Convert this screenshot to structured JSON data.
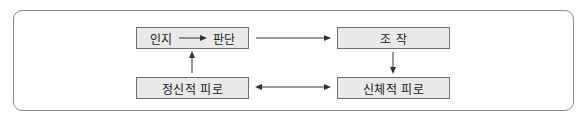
{
  "diagram": {
    "nodes": [
      {
        "id": "perception-judgment",
        "left": "인지",
        "right": "판단"
      },
      {
        "id": "mental-fatigue",
        "label": "정신적 피로"
      },
      {
        "id": "operation",
        "label": "조 작"
      },
      {
        "id": "physical-fatigue",
        "label": "신체적 피로"
      }
    ],
    "edges": [
      {
        "from": "인지",
        "to": "판단",
        "type": "arrow"
      },
      {
        "from": "인지 → 판단",
        "to": "조 작",
        "type": "arrow"
      },
      {
        "from": "조 작",
        "to": "신체적 피로",
        "type": "arrow"
      },
      {
        "from": "정신적 피로",
        "to": "인지 → 판단",
        "type": "arrow"
      },
      {
        "from": "정신적 피로",
        "to": "신체적 피로",
        "type": "bidirectional"
      }
    ],
    "colors": {
      "node_fill": "#e9e9e9",
      "node_border": "#6e6e6e",
      "frame_border": "#8a8a8a",
      "line": "#333333"
    }
  }
}
